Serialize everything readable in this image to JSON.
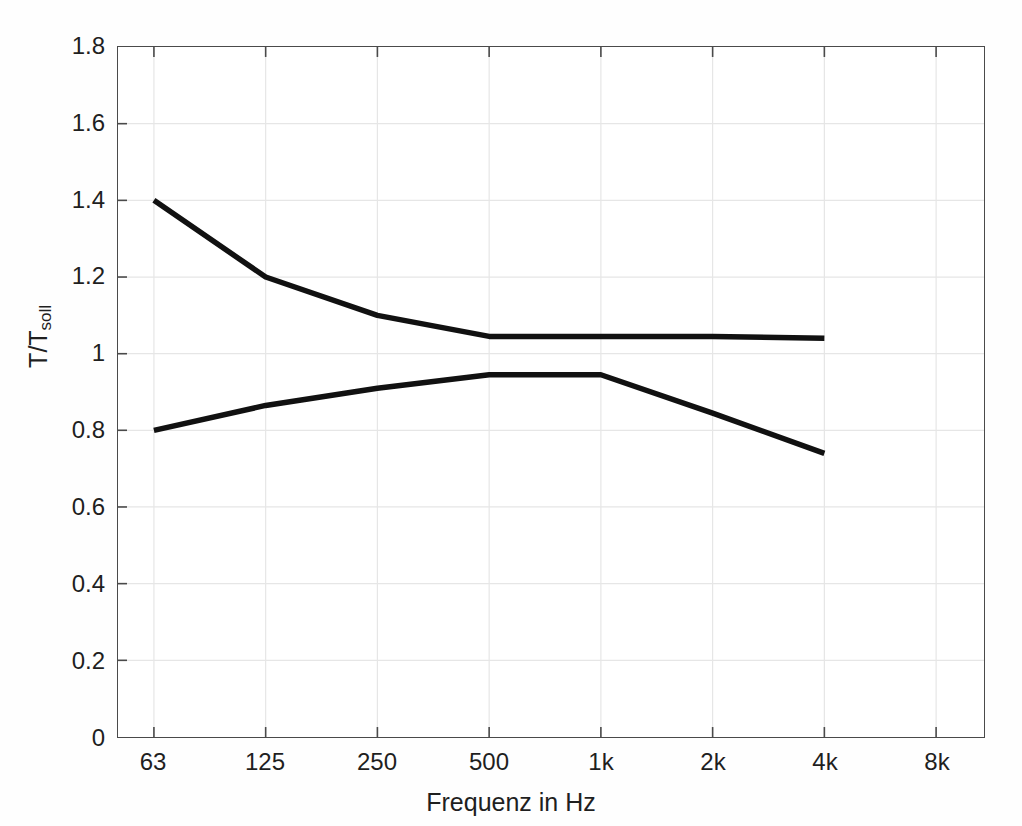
{
  "chart_data": {
    "type": "line",
    "title": "",
    "xlabel": "Frequenz in Hz",
    "ylabel": "T/T",
    "ylabel_sub": "soll",
    "categories": [
      "63",
      "125",
      "250",
      "500",
      "1k",
      "2k",
      "4k",
      "8k"
    ],
    "x_tick_labels": [
      "63",
      "125",
      "250",
      "500",
      "1k",
      "2k",
      "4k",
      "8k"
    ],
    "y_tick_labels": [
      "1.8",
      "1.6",
      "1.4",
      "1.2",
      "1",
      "0.8",
      "0.6",
      "0.4",
      "0.2",
      "0"
    ],
    "y_tick_values": [
      1.8,
      1.6,
      1.4,
      1.2,
      1.0,
      0.8,
      0.6,
      0.4,
      0.2,
      0.0
    ],
    "ylim": [
      0,
      1.8
    ],
    "xlim_categories": [
      "63",
      "8k"
    ],
    "grid": true,
    "grid_color": "#e3e3e3",
    "axis_color": "#4a4a4a",
    "line_color": "#111111",
    "line_width": 5,
    "legend": null,
    "legend_position": "none",
    "series": [
      {
        "name": "obere Toleranzgrenze",
        "x": [
          "63",
          "125",
          "250",
          "500",
          "1k",
          "2k",
          "4k"
        ],
        "values": [
          1.4,
          1.2,
          1.1,
          1.045,
          1.045,
          1.045,
          1.04
        ]
      },
      {
        "name": "untere Toleranzgrenze",
        "x": [
          "63",
          "125",
          "250",
          "500",
          "1k",
          "2k",
          "4k"
        ],
        "values": [
          0.8,
          0.865,
          0.91,
          0.945,
          0.945,
          0.845,
          0.74
        ]
      }
    ],
    "annotations": []
  },
  "figure": {
    "background_color": "#fefefe",
    "plot_background_color": "#ffffff"
  }
}
